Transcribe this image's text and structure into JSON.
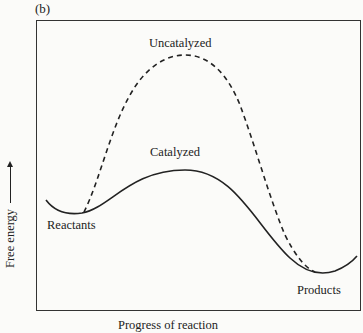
{
  "panel_label": "(b)",
  "axes": {
    "y_label": "Free energy",
    "y_arrow": "up-arrow",
    "x_label": "Progress of reaction"
  },
  "labels": {
    "uncatalyzed": "Uncatalyzed",
    "catalyzed": "Catalyzed",
    "reactants": "Reactants",
    "products": "Products"
  },
  "curves": {
    "uncatalyzed": {
      "style": "dashed",
      "color": "#222222"
    },
    "catalyzed": {
      "style": "solid",
      "color": "#222222"
    }
  }
}
